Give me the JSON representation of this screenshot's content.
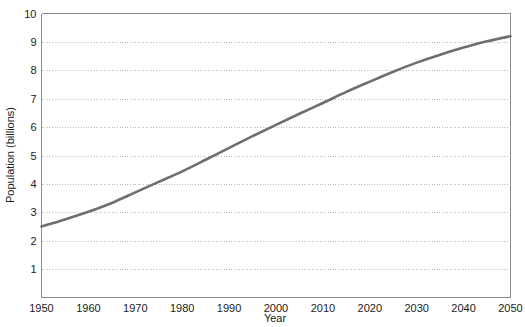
{
  "chart_data": {
    "type": "line",
    "title": "",
    "xlabel": "Year",
    "ylabel": "Population (billions)",
    "xlim": [
      1950,
      2050
    ],
    "ylim": [
      0,
      10
    ],
    "grid": true,
    "legend": "none",
    "x_ticks": [
      1950,
      1960,
      1970,
      1980,
      1990,
      2000,
      2010,
      2020,
      2030,
      2040,
      2050
    ],
    "y_ticks": [
      1,
      2,
      3,
      4,
      5,
      6,
      7,
      8,
      9,
      10
    ],
    "x_tick_labels": [
      "1950",
      "1960",
      "1970",
      "1980",
      "1990",
      "2000",
      "2010",
      "2020",
      "2030",
      "2040",
      "2050"
    ],
    "y_tick_labels": [
      "1",
      "2",
      "3",
      "4",
      "5",
      "6",
      "7",
      "8",
      "9",
      "10"
    ],
    "series": [
      {
        "name": "World population",
        "color": "#6e6e6e",
        "x": [
          1950,
          1955,
          1960,
          1965,
          1970,
          1975,
          1980,
          1985,
          1990,
          1995,
          2000,
          2005,
          2010,
          2015,
          2020,
          2025,
          2030,
          2035,
          2040,
          2045,
          2050
        ],
        "values": [
          2.5,
          2.75,
          3.02,
          3.33,
          3.7,
          4.07,
          4.44,
          4.85,
          5.27,
          5.68,
          6.08,
          6.47,
          6.85,
          7.24,
          7.6,
          7.95,
          8.27,
          8.55,
          8.8,
          9.02,
          9.2
        ]
      }
    ]
  },
  "axes": {
    "x_title": "Year",
    "y_title": "Population (billions)"
  }
}
